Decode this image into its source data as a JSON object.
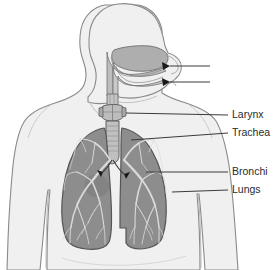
{
  "diagram": {
    "view": "anterior body silhouette with right-facing head profile",
    "colors": {
      "background": "#ffffff",
      "body_fill": "#f0f0f0",
      "body_outline": "#8a8a8a",
      "airway_fill": "#b8b8b8",
      "airway_outline": "#6e6e6e",
      "lung_fill": "#8d8d8d",
      "lung_outline": "#5a5a5a",
      "bronchial_tree": "#d8d8d8",
      "leader_line": "#3a3a3a",
      "label_text": "#2b2b2b",
      "arrow": "#1a1a1a"
    },
    "labels": [
      {
        "id": "label-unlabeled-upper",
        "text": "",
        "x": 212,
        "y": 66,
        "leader_from_x": 210,
        "leader_to_x": 163,
        "leader_y": 66
      },
      {
        "id": "label-unlabeled-lower",
        "text": "",
        "x": 212,
        "y": 82,
        "leader_from_x": 210,
        "leader_to_x": 163,
        "leader_y": 82
      },
      {
        "id": "label-larynx",
        "text": "Larynx",
        "x": 232,
        "y": 115,
        "leader_from_x": 228,
        "leader_to_x": 130,
        "leader_y": 115
      },
      {
        "id": "label-trachea",
        "text": "Trachea",
        "x": 232,
        "y": 133,
        "leader_from_x": 228,
        "leader_to_x": 131,
        "leader_y": 133
      },
      {
        "id": "label-bronchi",
        "text": "Bronchi",
        "x": 232,
        "y": 172,
        "leader_from_x": 228,
        "leader_to_x": 145,
        "leader_y": 172
      },
      {
        "id": "label-lungs",
        "text": "Lungs",
        "x": 232,
        "y": 190,
        "leader_from_x": 228,
        "leader_to_x": 172,
        "leader_y": 190
      }
    ],
    "parts": [
      {
        "id": "nasal-cavity",
        "name": "Nasal cavity"
      },
      {
        "id": "oral-cavity",
        "name": "Oral cavity"
      },
      {
        "id": "pharynx",
        "name": "Pharynx"
      },
      {
        "id": "larynx",
        "name": "Larynx"
      },
      {
        "id": "trachea",
        "name": "Trachea"
      },
      {
        "id": "bronchi",
        "name": "Bronchi"
      },
      {
        "id": "left-lung",
        "name": "Lung"
      },
      {
        "id": "right-lung",
        "name": "Lung"
      }
    ]
  }
}
